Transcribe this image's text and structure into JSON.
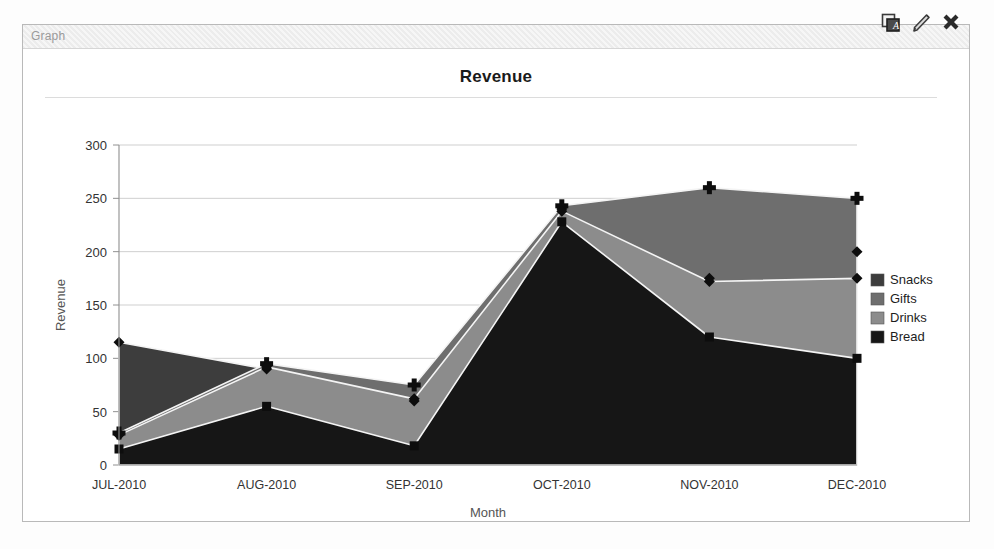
{
  "window": {
    "title": "Graph",
    "icons": [
      {
        "name": "duplicate-icon",
        "glyph": "copy"
      },
      {
        "name": "edit-pencil-icon",
        "glyph": "pencil"
      },
      {
        "name": "close-icon",
        "glyph": "x"
      }
    ]
  },
  "chart_data": {
    "type": "area",
    "title": "Revenue",
    "xlabel": "Month",
    "ylabel": "Revenue",
    "categories": [
      "JUL-2010",
      "AUG-2010",
      "SEP-2010",
      "OCT-2010",
      "NOV-2010",
      "DEC-2010"
    ],
    "yticks": [
      0,
      50,
      100,
      150,
      200,
      250,
      300
    ],
    "ylim": [
      0,
      300
    ],
    "grid": true,
    "legend_position": "right",
    "series": [
      {
        "name": "Snacks",
        "values": [
          115,
          90,
          60,
          240,
          175,
          200
        ],
        "color": "#3d3d3d",
        "marker": "diamond"
      },
      {
        "name": "Gifts",
        "values": [
          30,
          95,
          75,
          243,
          260,
          250
        ],
        "color": "#6e6e6e",
        "marker": "plus"
      },
      {
        "name": "Drinks",
        "values": [
          28,
          92,
          62,
          238,
          172,
          175
        ],
        "color": "#8c8c8c",
        "marker": "diamond"
      },
      {
        "name": "Bread",
        "values": [
          15,
          55,
          18,
          228,
          120,
          100
        ],
        "color": "#161616",
        "marker": "square"
      }
    ]
  }
}
